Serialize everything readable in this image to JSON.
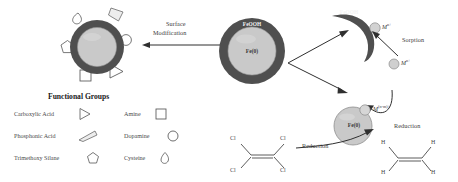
{
  "diagram": {
    "title_hidden": "",
    "particles": {
      "modified": {
        "name": "surface-modified nanoparticle",
        "shell_label": "",
        "core_label": ""
      },
      "center": {
        "shell_label": "FeOOH",
        "core_label": "Fe(0)"
      },
      "crescent": {
        "shell_label": "FeOOH"
      },
      "lower": {
        "core_label": "Fe(0)"
      }
    },
    "arrows": {
      "surface_modification": {
        "line1": "Surface",
        "line2": "Modification"
      },
      "sorption": "Sorption",
      "reduction_metal": "Reduction",
      "reduction_organic": "Reduction"
    },
    "ions": {
      "metal_free_top": "M",
      "metal_free_top_charge": "n+",
      "metal_free_bottom": "M",
      "metal_free_bottom_charge": "n+",
      "metal_reduced": "M",
      "metal_reduced_charge": "(n-m)+"
    },
    "molecules": {
      "tetrachloroethylene": {
        "name": "tetrachloroethylene",
        "atoms": [
          "Cl",
          "Cl",
          "Cl",
          "Cl"
        ]
      },
      "ethylene": {
        "name": "ethylene",
        "atoms": [
          "H",
          "H",
          "H",
          "H"
        ]
      }
    }
  },
  "legend": {
    "heading": "Functional Groups",
    "items": [
      {
        "label": "Carboxylic Acid",
        "shape": "triangle-right-icon",
        "column": "left",
        "row": 0
      },
      {
        "label": "Phosphonic Acid",
        "shape": "phosphonic-sliver-icon",
        "column": "left",
        "row": 1
      },
      {
        "label": "Trimethoxy Silane",
        "shape": "pentagon-icon",
        "column": "left",
        "row": 2
      },
      {
        "label": "Amine",
        "shape": "square-icon",
        "column": "right",
        "row": 0
      },
      {
        "label": "Dopamine",
        "shape": "circle-icon",
        "column": "right",
        "row": 1
      },
      {
        "label": "Cysteine",
        "shape": "teardrop-icon",
        "column": "right",
        "row": 2
      }
    ]
  },
  "colors": {
    "shell_dark": "#4f4f4f",
    "core_light": "#c9c9c9",
    "outline": "#3d3d3d",
    "text": "#3a3a3a",
    "background": "#ffffff"
  }
}
